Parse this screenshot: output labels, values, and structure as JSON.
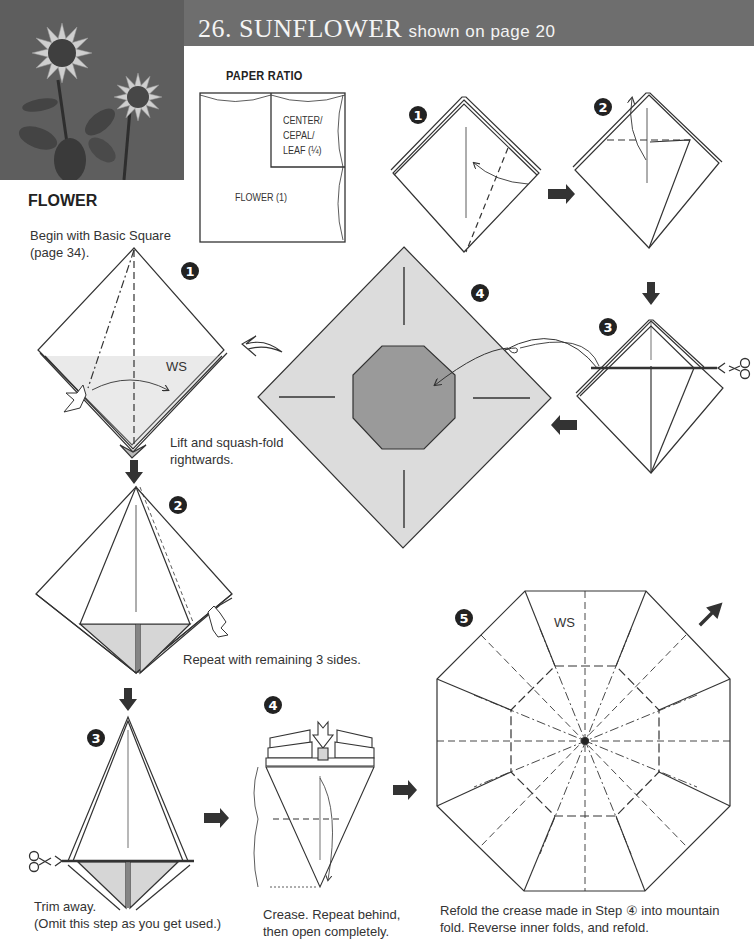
{
  "header": {
    "number_title": "26. SUNFLOWER",
    "subtitle": "shown on page 20",
    "band_color": "#6e6e6e"
  },
  "photo": {
    "alt": "sunflower-origami-photo"
  },
  "paper_ratio": {
    "label": "PAPER RATIO",
    "big_square": "FLOWER (1)",
    "small_square_lines": [
      "CENTER/",
      "CEPAL/",
      "LEAF (¼)"
    ]
  },
  "flower": {
    "section_title": "FLOWER",
    "intro_line1": "Begin with Basic Square",
    "intro_line2": "(page 34).",
    "steps": [
      {
        "number": "1",
        "label_ws": "WS",
        "caption_line1": "Lift and squash-fold",
        "caption_line2": "rightwards."
      },
      {
        "number": "2",
        "caption": "Repeat with remaining 3 sides."
      },
      {
        "number": "3",
        "caption_line1": "Trim away.",
        "caption_line2": "(Omit this step as you get used.)"
      },
      {
        "number": "4",
        "caption_line1": "Crease. Repeat behind,",
        "caption_line2": "then open completely."
      },
      {
        "number": "5",
        "label_ws": "WS",
        "caption_line1": "Refold the crease made in Step ④ into mountain",
        "caption_line2": "fold. Reverse inner folds, and refold."
      }
    ]
  },
  "center": {
    "steps": [
      {
        "number": "1"
      },
      {
        "number": "2"
      },
      {
        "number": "3"
      },
      {
        "number": "4"
      }
    ]
  },
  "colors": {
    "paper_gray": "#dcdcdc",
    "octagon_gray": "#9a9a9a",
    "line": "#333333",
    "arrow": "#333333"
  }
}
